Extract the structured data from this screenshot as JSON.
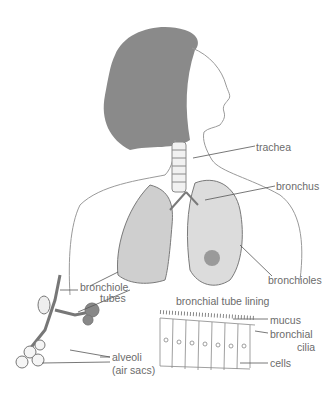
{
  "diagram": {
    "colors": {
      "ink": "#8a8a8a",
      "dark": "#7a7a7a",
      "label": "#6b6b6b",
      "background": "#ffffff"
    },
    "labels": {
      "trachea": "trachea",
      "bronchus": "bronchus",
      "bronchioles": "bronchioles",
      "bronchiole_line1": "bronchiole",
      "bronchiole_line2": "tubes",
      "tube_lining_title": "bronchial tube lining",
      "mucus": "mucus",
      "cilia_line1": "bronchial",
      "cilia_line2": "cilia",
      "cells": "cells",
      "alveoli_line1": "alveoli",
      "alveoli_line2": "(air sacs)"
    }
  }
}
